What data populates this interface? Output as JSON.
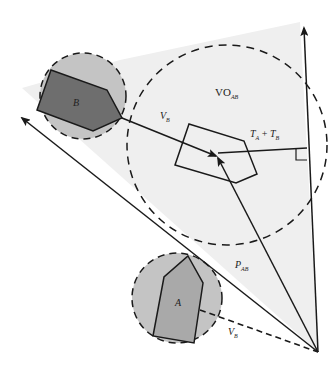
{
  "diagram": {
    "colors": {
      "background": "#ffffff",
      "cone_fill": "#efefef",
      "robot_circle_fill": "#c4c4c4",
      "robot_b_fill": "#6e6e6e",
      "robot_a_fill": "#a9a9a9",
      "stroke": "#1a1a1a"
    },
    "labels": {
      "vo": "VO",
      "vo_sub": "AB",
      "vb_upper": "V",
      "vb_upper_sub": "B",
      "ta_tb_t1": "T",
      "ta_tb_sub1": "A",
      "ta_tb_plus": " + ",
      "ta_tb_t2": "T",
      "ta_tb_sub2": "B",
      "pab": "P",
      "pab_sub": "AB",
      "vb_lower": "V",
      "vb_lower_sub": "B",
      "robot_a": "A",
      "robot_b": "B"
    },
    "elements": [
      {
        "name": "velocity-obstacle-cone",
        "type": "shaded-cone"
      },
      {
        "name": "vo-dashed-circle",
        "type": "dashed-circle"
      },
      {
        "name": "robot-b",
        "type": "polygon-in-dashed-circle"
      },
      {
        "name": "robot-a",
        "type": "polygon-in-dashed-circle"
      },
      {
        "name": "relative-position-polygon",
        "type": "polygon"
      },
      {
        "name": "vertical-axis-arrow",
        "type": "arrow"
      },
      {
        "name": "left-boundary-arrow",
        "type": "arrow"
      },
      {
        "name": "vb-vector",
        "type": "arrow"
      },
      {
        "name": "pab-vector",
        "type": "arrow"
      },
      {
        "name": "vb-dashed-vector",
        "type": "dashed-line"
      },
      {
        "name": "ta-tb-perpendicular",
        "type": "line-with-right-angle"
      }
    ]
  }
}
